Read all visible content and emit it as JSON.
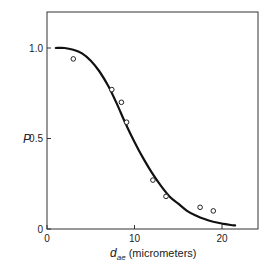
{
  "chart_data": {
    "type": "scatter",
    "title": "",
    "xlabel": "d_ae (micrometers)",
    "xlabel_main": "d",
    "xlabel_sub": "ae",
    "xlabel_units": " (micrometers)",
    "ylabel": "P",
    "xlim": [
      0,
      24
    ],
    "ylim": [
      0,
      1.2
    ],
    "x_ticks": [
      0,
      10,
      20
    ],
    "x_tick_labels": [
      "0",
      "10",
      "20"
    ],
    "y_ticks": [
      0,
      0.5,
      1.0
    ],
    "y_tick_labels": [
      "0",
      "0.5",
      "1.0"
    ],
    "grid": false,
    "legend": null,
    "series": [
      {
        "name": "measured",
        "marker": "open-circle",
        "x": [
          3.0,
          7.4,
          8.5,
          9.1,
          12.1,
          13.6,
          17.5,
          19.0
        ],
        "y": [
          0.94,
          0.77,
          0.7,
          0.59,
          0.27,
          0.18,
          0.12,
          0.1
        ]
      },
      {
        "name": "fitted curve",
        "style": "solid-line",
        "x": [
          1,
          2,
          3,
          4,
          5,
          6,
          7,
          8,
          9,
          10,
          11,
          12,
          13,
          14,
          15,
          16,
          17,
          18,
          19,
          20,
          21,
          21.5
        ],
        "y": [
          1.0,
          1.0,
          0.99,
          0.97,
          0.93,
          0.87,
          0.79,
          0.69,
          0.58,
          0.48,
          0.39,
          0.31,
          0.24,
          0.18,
          0.14,
          0.1,
          0.075,
          0.055,
          0.04,
          0.03,
          0.022,
          0.02
        ]
      }
    ]
  },
  "colors": {
    "ink": "#1a1a1a",
    "background": "#ffffff"
  }
}
